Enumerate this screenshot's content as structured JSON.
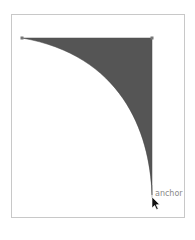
{
  "canvas": {
    "frame": {
      "x": 11,
      "y": 14,
      "width": 174,
      "height": 204,
      "border_color": "#c8c8c8"
    },
    "shape": {
      "fill": "#555555",
      "points": {
        "top_left": [
          22,
          38
        ],
        "top_right": [
          152,
          38
        ],
        "bottom": [
          152,
          195
        ]
      }
    },
    "hover_label": "anchor"
  },
  "cursor": {
    "icon": "arrow-pointer-icon",
    "x": 152,
    "y": 197
  }
}
